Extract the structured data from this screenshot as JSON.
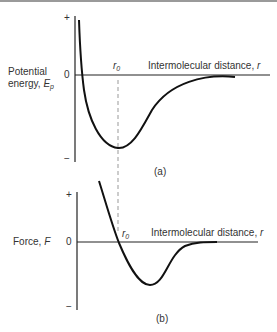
{
  "panel_a": {
    "ylabel_line1": "Potential",
    "ylabel_line2": "energy, ",
    "ylabel_symbol": "E",
    "ylabel_sub": "p",
    "plus": "+",
    "zero": "0",
    "minus": "−",
    "r0": "r",
    "r0_sub": "0",
    "xlabel": "Intermolecular distance, ",
    "xlabel_symbol": "r",
    "caption": "(a)"
  },
  "panel_b": {
    "ylabel": "Force, ",
    "ylabel_symbol": "F",
    "plus": "+",
    "zero": "0",
    "minus": "−",
    "r0": "r",
    "r0_sub": "0",
    "xlabel": "Intermolecular distance, ",
    "xlabel_symbol": "r",
    "caption": "(b)"
  },
  "colors": {
    "line": "#111111",
    "dash": "#999999",
    "text": "#333333"
  }
}
